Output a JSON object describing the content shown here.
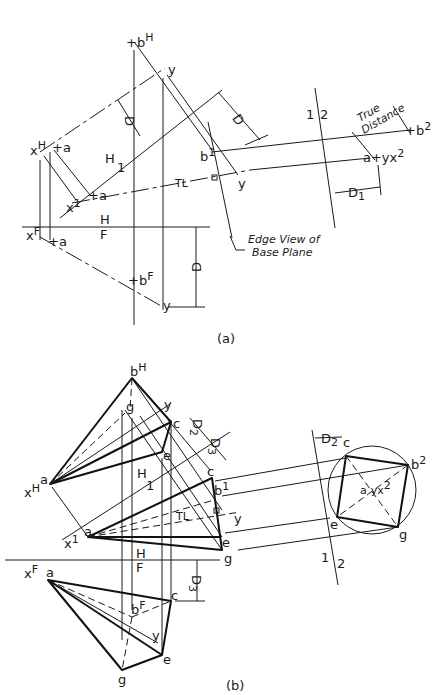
{
  "figure_a": {
    "caption": "(a)",
    "labels": {
      "bH": "b",
      "bH_sup": "H",
      "xH": "x",
      "xH_sup": "H",
      "aH": "a",
      "yH": "y",
      "D_top": "D",
      "D_right": "D",
      "H1_top": "H",
      "H1_bot": "1",
      "b1": "b",
      "b1_sup": "1",
      "a1": "a",
      "x1": "x",
      "x1_sup": "1",
      "TL": "TL",
      "y1": "y",
      "HF_top": "H",
      "HF_bot": "F",
      "xF": "x",
      "xF_sup": "F",
      "aF": "a",
      "bF": "b",
      "bF_sup": "F",
      "yF": "y",
      "D_bottom": "D",
      "plane12_left": "1",
      "plane12_right": "2",
      "true_distance_1": "True",
      "true_distance_2": "Distance",
      "b2": "b",
      "b2_sup": "2",
      "ayx2": "a+yx",
      "ayx2_sup": "2",
      "D1": "D",
      "D1_sub": "1",
      "edge_view_1": "Edge View of",
      "edge_view_2": "Base Plane"
    }
  },
  "figure_b": {
    "caption": "(b)",
    "labels": {
      "bH": "b",
      "bH_sup": "H",
      "gH": "g",
      "yH": "y",
      "cH": "c",
      "eH": "e",
      "aH": "a",
      "xH": "x",
      "xH_sup": "H",
      "D2": "D",
      "D2_sub": "2",
      "D3": "D",
      "D3_sub": "3",
      "H1_top": "H",
      "H1_bot": "1",
      "c1": "c",
      "b1": "b",
      "b1_sup": "1",
      "TL": "TL",
      "y1": "y",
      "a1": "a",
      "x1": "x",
      "x1_sup": "1",
      "e1": "e",
      "g1": "g",
      "HF_top": "H",
      "HF_bot": "F",
      "xF": "x",
      "xF_sup": "F",
      "aF": "a",
      "cF": "c",
      "bF": "b",
      "bF_sup": "F",
      "yF": "y",
      "eF": "e",
      "gF": "g",
      "D3_bottom": "D",
      "D3_bottom_sub": "3",
      "D2_right": "D",
      "D2_right_sub": "2",
      "c2": "c",
      "b2": "b",
      "b2_sup": "2",
      "ayx2": "a",
      "ayx2_mid": "yx",
      "ayx2_sup": "2",
      "e2": "e",
      "g2": "g",
      "plane12_left": "1",
      "plane12_right": "2"
    }
  }
}
